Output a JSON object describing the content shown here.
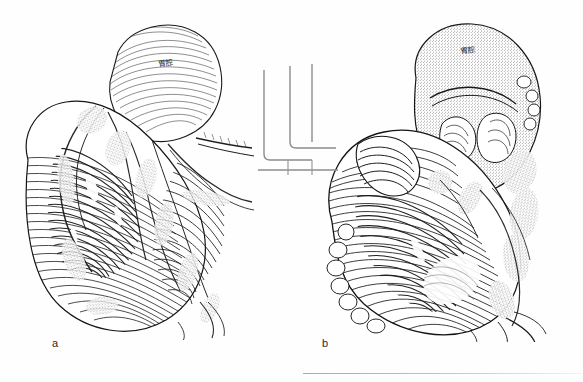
{
  "plate": {
    "width": 583,
    "height": 382,
    "background_color": "#ffffff",
    "ink_color": "#1a1a1a",
    "media": "scanned monochrome line engraving",
    "subject": "comparative anatomical dissection, two views"
  },
  "figures": [
    {
      "id": "a",
      "caption": "a",
      "caption_x": 52,
      "caption_y": 338,
      "labels": [
        {
          "name": "organ-label-a",
          "text": "胃腔",
          "x": 158,
          "y": 57,
          "rotation": -12,
          "target": "pale rounded sac at upper portion of specimen"
        }
      ],
      "description": "Left view: large dark cross-hatched lobed mass occupying lower two thirds, with a pale finely-lined rounded sac at top right and stippled connective tissue fronds along the left margin and centre."
    },
    {
      "id": "b",
      "caption": "b",
      "caption_x": 322,
      "caption_y": 338,
      "labels": [
        {
          "name": "organ-label-b",
          "text": "胃腔",
          "x": 460,
          "y": 44,
          "rotation": -10,
          "target": "stippled rounded sac at upper portion of specimen"
        }
      ],
      "description": "Right view: coiled dark hatched tubular mass forming a spiral in the lower portion, surmounted by a stippled pale sac; nodular glandular tissue along lower-left border and trailing strands to the lower right."
    }
  ],
  "scan_artifacts": {
    "name": "ruler-line-artifacts",
    "description": "Faint rounded-corner rule lines from adjacent page bleed-through, between the two figures",
    "lines": [
      {
        "orientation": "vertical",
        "x": 263,
        "y": 72,
        "length": 118
      },
      {
        "orientation": "vertical",
        "x": 289,
        "y": 68,
        "length": 88
      },
      {
        "orientation": "vertical",
        "x": 311,
        "y": 66,
        "length": 80
      },
      {
        "orientation": "horizontal",
        "x": 263,
        "y": 149,
        "length": 58
      },
      {
        "orientation": "horizontal",
        "x": 263,
        "y": 158,
        "length": 58
      }
    ],
    "bottom_rule": {
      "x": 303,
      "y": 373,
      "length": 280
    }
  }
}
